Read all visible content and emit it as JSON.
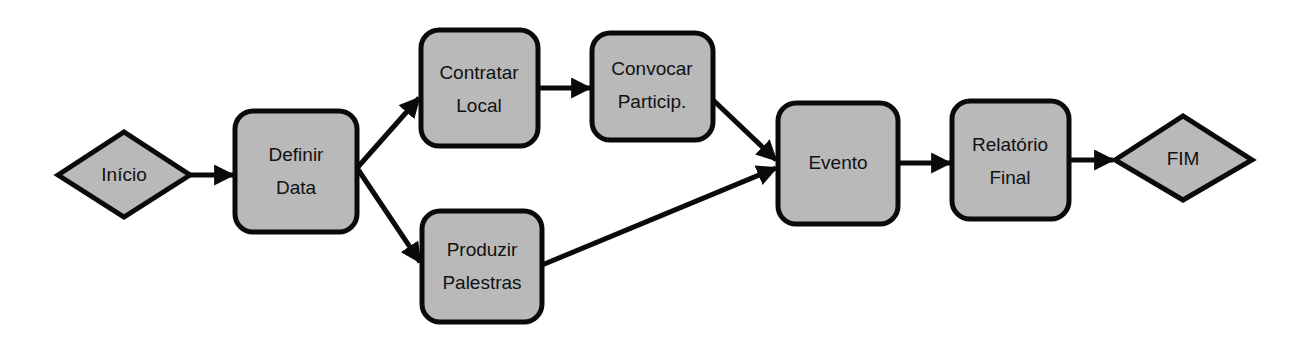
{
  "diagram": {
    "type": "flowchart",
    "colors": {
      "node_fill": "#b9b9b9",
      "stroke": "#0a0a0a",
      "background": "#ffffff",
      "text": "#111111"
    },
    "nodes": [
      {
        "id": "inicio",
        "shape": "diamond",
        "lines": [
          "Início"
        ]
      },
      {
        "id": "definir",
        "shape": "rounded-rect",
        "lines": [
          "Definir",
          "Data"
        ]
      },
      {
        "id": "contratar",
        "shape": "rounded-rect",
        "lines": [
          "Contratar",
          "Local"
        ]
      },
      {
        "id": "convocar",
        "shape": "rounded-rect",
        "lines": [
          "Convocar",
          "Particip."
        ]
      },
      {
        "id": "produzir",
        "shape": "rounded-rect",
        "lines": [
          "Produzir",
          "Palestras"
        ]
      },
      {
        "id": "evento",
        "shape": "rounded-rect",
        "lines": [
          "Evento"
        ]
      },
      {
        "id": "relatorio",
        "shape": "rounded-rect",
        "lines": [
          "Relatório",
          "Final"
        ]
      },
      {
        "id": "fim",
        "shape": "diamond",
        "lines": [
          "FIM"
        ]
      }
    ],
    "edges": [
      {
        "from": "inicio",
        "to": "definir"
      },
      {
        "from": "definir",
        "to": "contratar"
      },
      {
        "from": "definir",
        "to": "produzir"
      },
      {
        "from": "contratar",
        "to": "convocar"
      },
      {
        "from": "convocar",
        "to": "evento"
      },
      {
        "from": "produzir",
        "to": "evento"
      },
      {
        "from": "evento",
        "to": "relatorio"
      },
      {
        "from": "relatorio",
        "to": "fim"
      }
    ]
  }
}
